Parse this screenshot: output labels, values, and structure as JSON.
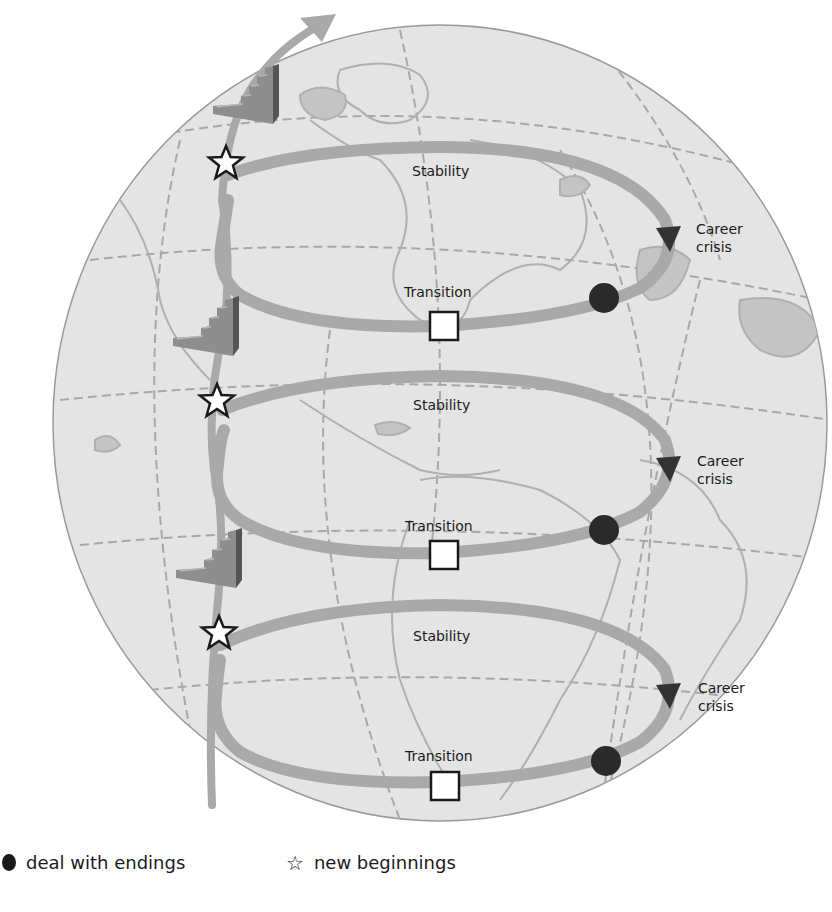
{
  "figure": {
    "colors": {
      "background": "#ffffff",
      "globe_fill": "#e4e4e4",
      "globe_edge": "#9a9a9a",
      "land": "#bdbdbd",
      "gridlines": "#a8a8a8",
      "spiral_band": "#a9a9a9",
      "stairs_light": "#8e8e8e",
      "stairs_dark": "#555555",
      "ending_marker": "#2a2a2a",
      "arrowhead": "#333333"
    }
  },
  "cycles": [
    {
      "stability_label": "Stability",
      "crisis_label_line1": "Career",
      "crisis_label_line2": "crisis",
      "transition_label": "Transition"
    },
    {
      "stability_label": "Stability",
      "crisis_label_line1": "Career",
      "crisis_label_line2": "crisis",
      "transition_label": "Transition"
    },
    {
      "stability_label": "Stability",
      "crisis_label_line1": "Career",
      "crisis_label_line2": "crisis",
      "transition_label": "Transition"
    }
  ],
  "legend": {
    "endings": {
      "icon": "filled-circle-icon",
      "label": "deal with endings"
    },
    "beginnings": {
      "icon": "star-outline-icon",
      "glyph": "☆",
      "label": "new beginnings"
    }
  }
}
